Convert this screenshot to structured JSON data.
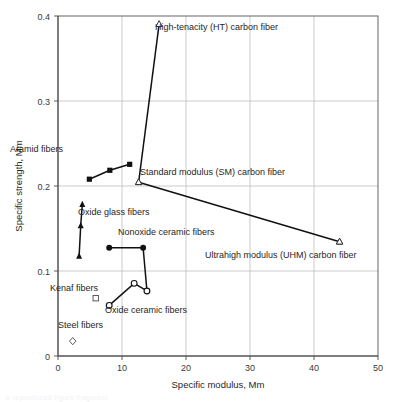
{
  "figure": {
    "background_color": "#ffffff",
    "line_color": "#111111",
    "grid_color": "#b4b4b4",
    "axis_color": "#4a4a4a",
    "caption_faint": "a reproduced figure fragment"
  },
  "chart_data": {
    "type": "scatter",
    "title": "",
    "subtitle": "",
    "xlabel": "Specific modulus, Mm",
    "ylabel": "Specific strength, Mm",
    "xlim": [
      0,
      50
    ],
    "ylim": [
      0,
      0.4
    ],
    "xticks": [
      0,
      10,
      20,
      30,
      40,
      50
    ],
    "xtick_labels": [
      "0",
      "10",
      "20",
      "30",
      "40",
      "50"
    ],
    "yticks": [
      0,
      0.1,
      0.2,
      0.3,
      0.4
    ],
    "ytick_labels": [
      "0",
      "0.1",
      "0.2",
      "0.3",
      "0.4"
    ],
    "grid": true,
    "grid_axes": "both",
    "legend": "none (direct annotations)",
    "series": [
      {
        "name": "Aramid fibers",
        "marker": "filled-square",
        "connected": true,
        "points": [
          {
            "x": 4.9,
            "y": 0.208
          },
          {
            "x": 8.1,
            "y": 0.2185
          },
          {
            "x": 11.2,
            "y": 0.2255
          }
        ]
      },
      {
        "name": "High-tenacity (HT) carbon fiber",
        "marker": "open-triangle",
        "connected": true,
        "points": [
          {
            "x": 12.6,
            "y": 0.2045
          },
          {
            "x": 15.8,
            "y": 0.3905
          }
        ]
      },
      {
        "name": "Standard modulus (SM) carbon fiber",
        "marker": "open-triangle",
        "connected": true,
        "points": [
          {
            "x": 12.6,
            "y": 0.2045
          },
          {
            "x": 44.0,
            "y": 0.1345
          }
        ]
      },
      {
        "name": "Ultrahigh modulus (UHM) carbon fiber",
        "marker": "open-triangle",
        "connected": false,
        "points": [
          {
            "x": 44.0,
            "y": 0.1345
          }
        ]
      },
      {
        "name": "Oxide glass fibers",
        "marker": "filled-triangle",
        "connected": true,
        "points": [
          {
            "x": 3.3,
            "y": 0.1175
          },
          {
            "x": 3.55,
            "y": 0.1535
          },
          {
            "x": 3.8,
            "y": 0.1785
          }
        ]
      },
      {
        "name": "Nonoxide ceramic fibers",
        "marker": "filled-circle",
        "connected": true,
        "points": [
          {
            "x": 8.0,
            "y": 0.1275
          },
          {
            "x": 13.3,
            "y": 0.1275
          },
          {
            "x": 13.9,
            "y": 0.0765
          }
        ]
      },
      {
        "name": "Oxide ceramic fibers",
        "marker": "open-circle",
        "connected": true,
        "points": [
          {
            "x": 8.0,
            "y": 0.0595
          },
          {
            "x": 11.9,
            "y": 0.0855
          },
          {
            "x": 13.9,
            "y": 0.0765
          }
        ]
      },
      {
        "name": "Kenaf fibers",
        "marker": "open-square",
        "connected": false,
        "points": [
          {
            "x": 5.9,
            "y": 0.068
          }
        ]
      },
      {
        "name": "Steel fibers",
        "marker": "open-diamond",
        "connected": false,
        "points": [
          {
            "x": 2.3,
            "y": 0.0175
          }
        ]
      }
    ],
    "annotations": [
      {
        "id": "aramid",
        "text": "Aramid fibers",
        "x": 10,
        "y": 152,
        "anchor": "start"
      },
      {
        "id": "ht",
        "text": "High-tenacity (HT) carbon fiber",
        "x": 155,
        "y": 30,
        "anchor": "start"
      },
      {
        "id": "sm",
        "text": "Standard modulus (SM) carbon fiber",
        "x": 140,
        "y": 175,
        "anchor": "start"
      },
      {
        "id": "uhm",
        "text": "Ultrahigh modulus (UHM) carbon fiber",
        "x": 205,
        "y": 258,
        "anchor": "start"
      },
      {
        "id": "oxide-glass",
        "text": "Oxide glass fibers",
        "x": 78,
        "y": 215,
        "anchor": "start"
      },
      {
        "id": "nonoxide",
        "text": "Nonoxide ceramic fibers",
        "x": 118,
        "y": 235,
        "anchor": "start"
      },
      {
        "id": "oxide-ceramic",
        "text": "Oxide ceramic fibers",
        "x": 105,
        "y": 313,
        "anchor": "start"
      },
      {
        "id": "kenaf",
        "text": "Kenaf fibers",
        "x": 50,
        "y": 291,
        "anchor": "start"
      },
      {
        "id": "steel",
        "text": "Steel fibers",
        "x": 58,
        "y": 328,
        "anchor": "start"
      }
    ]
  }
}
